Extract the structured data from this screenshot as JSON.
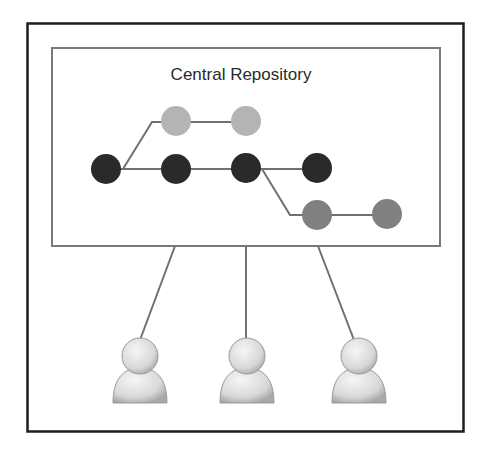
{
  "diagram": {
    "title": "Central Repository",
    "colors": {
      "frame": "#1e1e1e",
      "repo_border": "#7a7a7a",
      "line": "#707070",
      "main_branch": "#2a2a2a",
      "upper_branch": "#b4b4b4",
      "lower_branch": "#808080",
      "user_fill": "#e0e0e0"
    },
    "branches": [
      {
        "name": "main",
        "commits": 4
      },
      {
        "name": "upper-branch",
        "commits": 2
      },
      {
        "name": "lower-branch",
        "commits": 2
      }
    ],
    "users": [
      {
        "name": "user-1"
      },
      {
        "name": "user-2"
      },
      {
        "name": "user-3"
      }
    ]
  }
}
